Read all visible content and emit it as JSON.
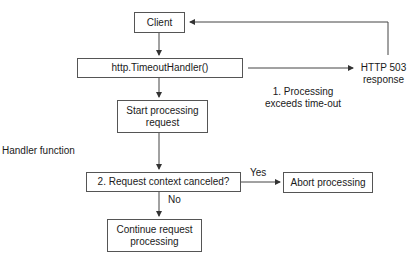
{
  "diagram": {
    "nodes": {
      "client": "Client",
      "timeout_handler": "http.TimeoutHandler()",
      "start_processing": "Start processing request",
      "request_context_check": "2. Request context canceled?",
      "abort_processing": "Abort processing",
      "continue_processing": "Continue request processing"
    },
    "labels": {
      "http503_line1": "HTTP 503",
      "http503_line2": "response",
      "timeout_line1": "1. Processing",
      "timeout_line2": "exceeds time-out",
      "handler_function": "Handler function",
      "yes": "Yes",
      "no": "No"
    },
    "edges": [
      {
        "from": "client",
        "to": "timeout_handler"
      },
      {
        "from": "timeout_handler",
        "to": "http503",
        "label": "1. Processing exceeds time-out"
      },
      {
        "from": "http503",
        "to": "client"
      },
      {
        "from": "timeout_handler",
        "to": "start_processing"
      },
      {
        "from": "start_processing",
        "to": "request_context_check"
      },
      {
        "from": "request_context_check",
        "to": "abort_processing",
        "label": "Yes"
      },
      {
        "from": "request_context_check",
        "to": "continue_processing",
        "label": "No"
      }
    ]
  }
}
